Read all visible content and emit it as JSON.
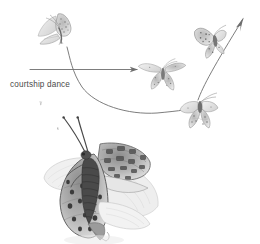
{
  "figure": {
    "medium": "pencil-sketch",
    "background_color": "#ffffff",
    "ink_color": "#6e6e6e",
    "label_color": "#4a4a4a",
    "shading_light": "#cfcfcf",
    "shading_mid": "#9a9a9a",
    "shading_dark": "#5a5a5a"
  },
  "annotations": {
    "courtship_dance_label": "courtship dance"
  },
  "arrows": [
    {
      "name": "straight-arrow",
      "description": "horizontal arrow pointing right",
      "direction": "right",
      "start": [
        30,
        69
      ],
      "end": [
        140,
        69
      ]
    },
    {
      "name": "curved-arrow",
      "description": "curved swooping path descending then rising to the right",
      "direction": "right",
      "start": [
        66,
        48
      ],
      "end": [
        185,
        110
      ]
    },
    {
      "name": "ascending-arrow",
      "description": "arrow rising up and to the right out of frame",
      "direction": "up-right",
      "start": [
        206,
        48
      ],
      "end": [
        246,
        17
      ]
    }
  ],
  "butterflies": [
    {
      "name": "butterfly-upper-left",
      "pose": "wings-raised-side-view",
      "position": [
        58,
        30
      ],
      "scale": 1.0
    },
    {
      "name": "butterfly-middle",
      "pose": "wings-spread-forward",
      "position": [
        163,
        72
      ],
      "scale": 0.9
    },
    {
      "name": "butterfly-upper-right",
      "pose": "wings-open-ascending",
      "position": [
        214,
        40
      ],
      "scale": 1.0
    },
    {
      "name": "butterfly-lower-right",
      "pose": "wings-down-descending",
      "position": [
        200,
        108
      ],
      "scale": 0.95
    },
    {
      "name": "butterfly-detail-large",
      "pose": "perched-wings-half-open",
      "position": [
        100,
        178
      ],
      "scale": 3.6
    }
  ]
}
